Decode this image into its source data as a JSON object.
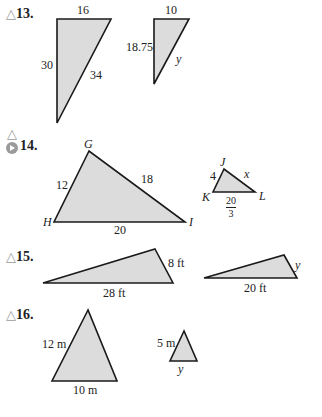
{
  "problems": [
    {
      "number": "13.",
      "icon": "triangle-icon",
      "figure1": {
        "top": "16",
        "left": "30",
        "hypotenuse": "34"
      },
      "figure2": {
        "top": "10",
        "left": "18.75",
        "hypotenuse": "y"
      }
    },
    {
      "number": "14.",
      "icons": [
        "triangle-icon",
        "play-icon"
      ],
      "figure1": {
        "vertices": [
          "G",
          "H",
          "I"
        ],
        "GH": "12",
        "GI": "18",
        "HI": "20"
      },
      "figure2": {
        "vertices": [
          "J",
          "K",
          "L"
        ],
        "JK": "4",
        "JL": "x",
        "KL_num": "20",
        "KL_den": "3"
      }
    },
    {
      "number": "15.",
      "icon": "triangle-icon",
      "figure1": {
        "right": "8 ft",
        "base": "28 ft"
      },
      "figure2": {
        "right": "y",
        "base": "20 ft"
      }
    },
    {
      "number": "16.",
      "icon": "triangle-icon",
      "figure1": {
        "left": "12 m",
        "base": "10 m"
      },
      "figure2": {
        "left": "5 m",
        "base": "y"
      }
    }
  ],
  "colors": {
    "fill": "#dcdcdc",
    "stroke": "#1a1a1a",
    "icon": "#9a9a9a"
  }
}
